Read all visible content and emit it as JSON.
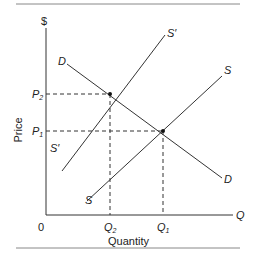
{
  "diagram": {
    "type": "supply-demand-shift",
    "axes": {
      "y_symbol": "$",
      "y_label": "Price",
      "x_symbol": "Q",
      "x_label": "Quantity",
      "origin": "0"
    },
    "price_levels": [
      {
        "label": "P",
        "sub": "2"
      },
      {
        "label": "P",
        "sub": "1"
      }
    ],
    "quantity_levels": [
      {
        "label": "Q",
        "sub": "2"
      },
      {
        "label": "Q",
        "sub": "1"
      }
    ],
    "curves": {
      "demand": {
        "top": "D",
        "bottom": "D"
      },
      "supply": {
        "top": "S",
        "bottom": "S"
      },
      "supply_shifted": {
        "top": "S′",
        "bottom": "S′"
      }
    },
    "colors": {
      "line": "#333333",
      "rule": "#777777",
      "text": "#222222"
    }
  }
}
